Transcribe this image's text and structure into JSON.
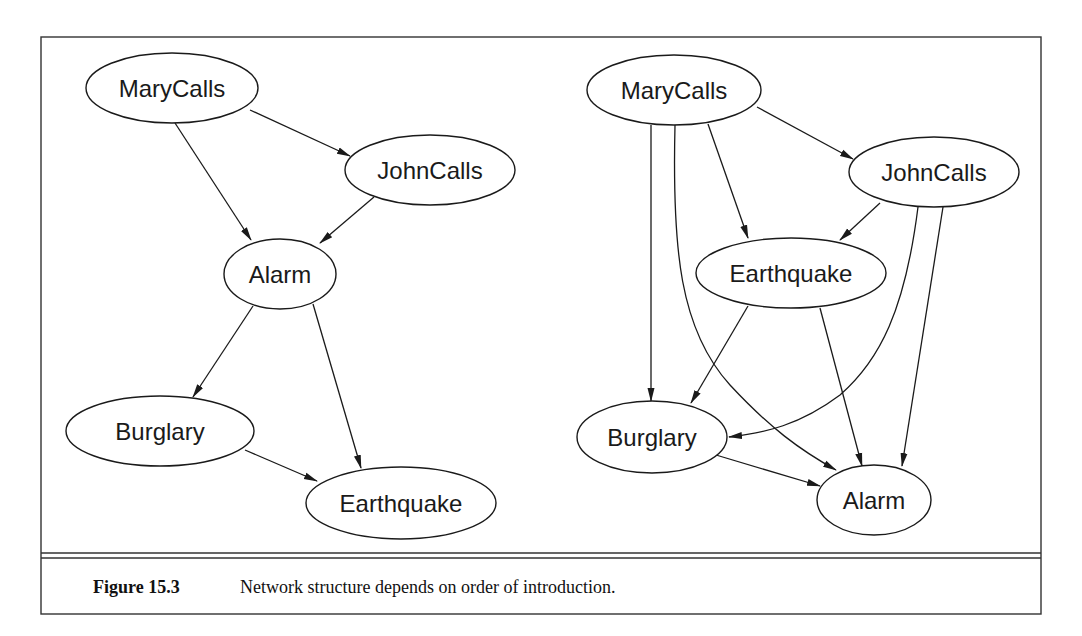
{
  "figure": {
    "number": "Figure 15.3",
    "caption": "Network structure depends on order of introduction."
  },
  "left_network": {
    "nodes": [
      {
        "id": "MaryCalls",
        "label": "MaryCalls",
        "cx": 172,
        "cy": 88,
        "rx": 86,
        "ry": 35
      },
      {
        "id": "JohnCalls",
        "label": "JohnCalls",
        "cx": 430,
        "cy": 170,
        "rx": 85,
        "ry": 35
      },
      {
        "id": "Alarm",
        "label": "Alarm",
        "cx": 280,
        "cy": 274,
        "rx": 56,
        "ry": 35
      },
      {
        "id": "Burglary",
        "label": "Burglary",
        "cx": 160,
        "cy": 431,
        "rx": 94,
        "ry": 35
      },
      {
        "id": "Earthquake",
        "label": "Earthquake",
        "cx": 401,
        "cy": 503,
        "rx": 95,
        "ry": 36
      }
    ],
    "edges": [
      {
        "from": "MaryCalls",
        "to": "JohnCalls"
      },
      {
        "from": "MaryCalls",
        "to": "Alarm"
      },
      {
        "from": "JohnCalls",
        "to": "Alarm"
      },
      {
        "from": "Alarm",
        "to": "Burglary"
      },
      {
        "from": "Alarm",
        "to": "Earthquake"
      },
      {
        "from": "Burglary",
        "to": "Earthquake"
      }
    ]
  },
  "right_network": {
    "nodes": [
      {
        "id": "MaryCalls",
        "label": "MaryCalls",
        "cx": 674,
        "cy": 90,
        "rx": 87,
        "ry": 35
      },
      {
        "id": "JohnCalls",
        "label": "JohnCalls",
        "cx": 934,
        "cy": 172,
        "rx": 85,
        "ry": 35
      },
      {
        "id": "Earthquake",
        "label": "Earthquake",
        "cx": 791,
        "cy": 273,
        "rx": 95,
        "ry": 35
      },
      {
        "id": "Burglary",
        "label": "Burglary",
        "cx": 652,
        "cy": 437,
        "rx": 75,
        "ry": 36
      },
      {
        "id": "Alarm",
        "label": "Alarm",
        "cx": 874,
        "cy": 500,
        "rx": 57,
        "ry": 35
      }
    ],
    "edges": [
      {
        "from": "MaryCalls",
        "to": "JohnCalls"
      },
      {
        "from": "MaryCalls",
        "to": "Earthquake"
      },
      {
        "from": "MaryCalls",
        "to": "Burglary"
      },
      {
        "from": "MaryCalls",
        "to": "Alarm"
      },
      {
        "from": "JohnCalls",
        "to": "Earthquake"
      },
      {
        "from": "JohnCalls",
        "to": "Burglary"
      },
      {
        "from": "JohnCalls",
        "to": "Alarm"
      },
      {
        "from": "Earthquake",
        "to": "Burglary"
      },
      {
        "from": "Earthquake",
        "to": "Alarm"
      },
      {
        "from": "Burglary",
        "to": "Alarm"
      }
    ]
  },
  "colors": {
    "ink": "#1a1a1a",
    "frame": "#333333",
    "background": "#ffffff"
  }
}
